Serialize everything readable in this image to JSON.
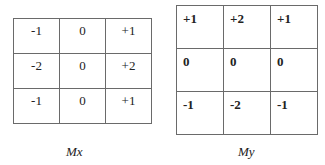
{
  "matrices": [
    {
      "name": "Mx",
      "rows": [
        [
          "-1",
          "0",
          "+1"
        ],
        [
          "-2",
          "0",
          "+2"
        ],
        [
          "-1",
          "0",
          "+1"
        ]
      ],
      "label": "Mx"
    },
    {
      "name": "My",
      "rows": [
        [
          "+1",
          "+2",
          "+1"
        ],
        [
          "0",
          "0",
          "0"
        ],
        [
          "-1",
          "-2",
          "-1"
        ]
      ],
      "label": "My"
    }
  ]
}
